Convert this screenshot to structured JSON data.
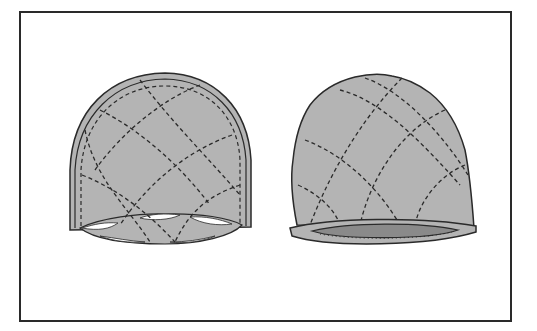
{
  "figure": {
    "colors": {
      "fabric": "#b4b4b4",
      "outline": "#2a2a2a",
      "stitch": "#2a2a2a",
      "lining": "#8a8a8a",
      "background": "#ffffff"
    },
    "items": [
      {
        "name": "cap-inside-view",
        "label": ""
      },
      {
        "name": "cap-finished-view",
        "label": ""
      }
    ]
  }
}
